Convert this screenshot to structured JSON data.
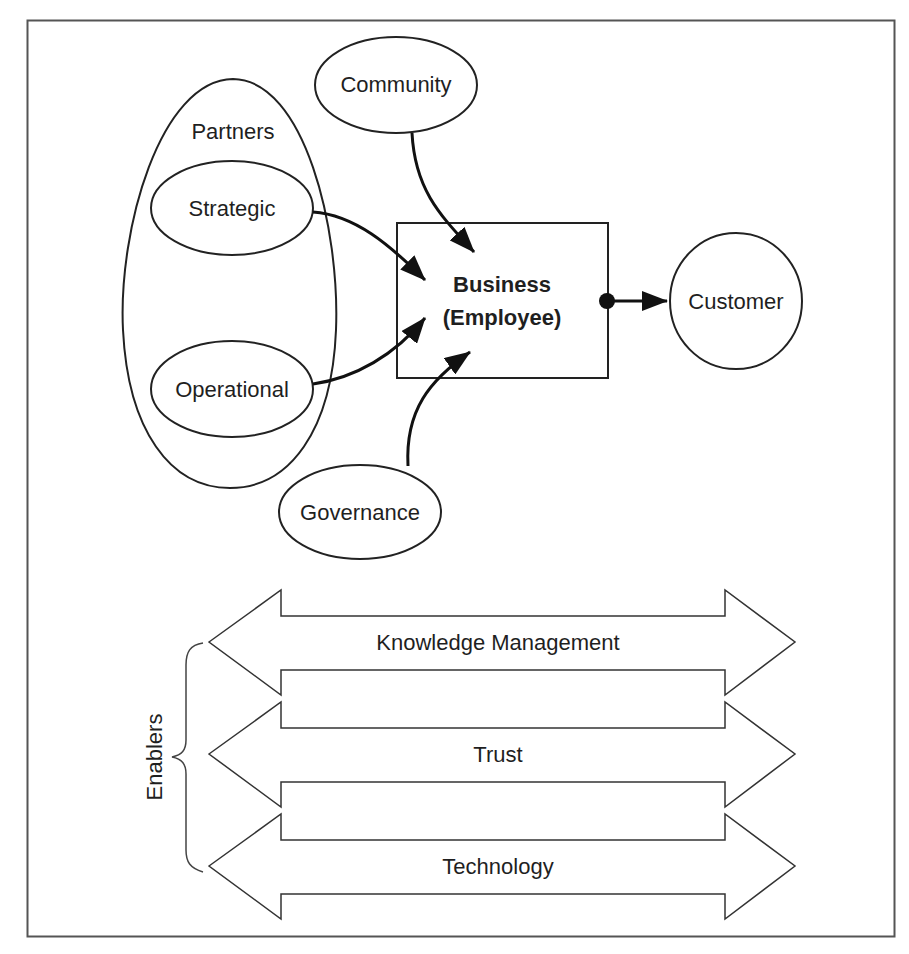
{
  "diagram": {
    "nodes": {
      "partners_group": "Partners",
      "strategic": "Strategic",
      "operational": "Operational",
      "community": "Community",
      "business_line1": "Business",
      "business_line2": "(Employee)",
      "governance": "Governance",
      "customer": "Customer"
    },
    "edges": [
      {
        "from": "Community",
        "to": "Business (Employee)"
      },
      {
        "from": "Strategic",
        "to": "Business (Employee)"
      },
      {
        "from": "Operational",
        "to": "Business (Employee)"
      },
      {
        "from": "Governance",
        "to": "Business (Employee)"
      },
      {
        "from": "Business (Employee)",
        "to": "Customer"
      }
    ],
    "enablers": {
      "label": "Enablers",
      "items": [
        "Knowledge Management",
        "Trust",
        "Technology"
      ]
    }
  }
}
